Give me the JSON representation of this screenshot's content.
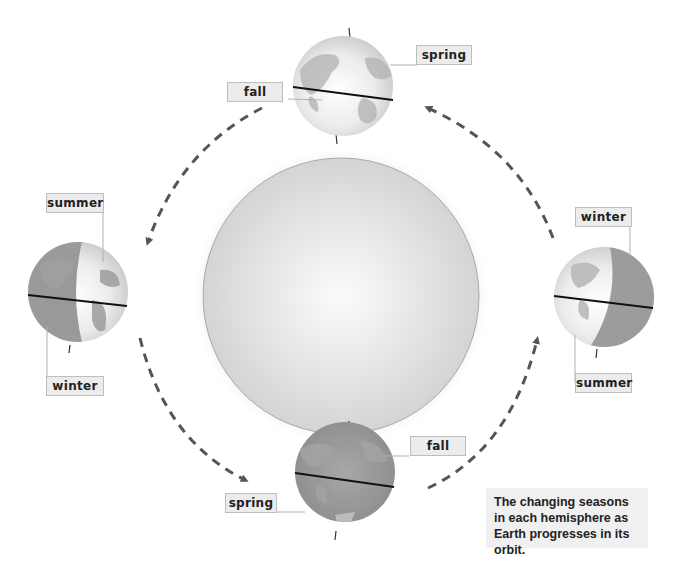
{
  "diagram": {
    "sun": {
      "name": "Sun",
      "color": "#d9d9d9"
    },
    "positions": [
      {
        "id": "top",
        "northern": "spring",
        "southern": "fall"
      },
      {
        "id": "left",
        "northern": "summer",
        "southern": "winter"
      },
      {
        "id": "right",
        "northern": "winter",
        "southern": "summer"
      },
      {
        "id": "bottom",
        "northern": "fall",
        "southern": "spring"
      }
    ],
    "labels": {
      "top_spring": "spring",
      "top_fall": "fall",
      "left_summer": "summer",
      "left_winter": "winter",
      "right_winter": "winter",
      "right_summer": "summer",
      "bottom_fall": "fall",
      "bottom_spring": "spring"
    },
    "orbit_direction": "counterclockwise",
    "caption": "The changing seasons in each hemisphere as Earth progresses in its orbit.",
    "colors": {
      "arrow": "#555555",
      "label_bg": "#ececec",
      "label_border": "#bdbdbd",
      "caption_bg": "#f0f0f0"
    }
  }
}
